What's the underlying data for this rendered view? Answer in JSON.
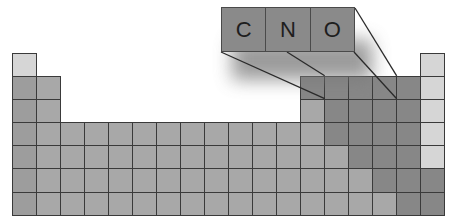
{
  "figure": {
    "callout": {
      "elements": [
        {
          "symbol": "C"
        },
        {
          "symbol": "N"
        },
        {
          "symbol": "O"
        }
      ]
    },
    "colors": {
      "light": "#d6d6d6",
      "mid": "#a8a8a8",
      "alkali": "#9d9d9d",
      "dark": "#878787",
      "callout": "#8a8a8a",
      "border": "#3a3a3a"
    },
    "grid": {
      "columns": 18,
      "rows": 7,
      "origin_x": 12,
      "origin_y": 52.7,
      "cell_w": 24,
      "cell_h": 23.15,
      "layout": [
        "L................L",
        "AM..........DDDDDL",
        "AM..........MDDDDL",
        "AMMMMMMMMMMMMDDDDL",
        "AMMMMMMMMMMMMMDDDL",
        "AMMMMMMMMMMMMMMDDD",
        "AMMMMMMMMMMMMMMMDD"
      ]
    },
    "zoom_lines": [
      {
        "x1": 221,
        "y1": 52,
        "x2": 324.7,
        "y2": 98.7
      },
      {
        "x1": 287,
        "y1": 52,
        "x2": 324.7,
        "y2": 75.8
      },
      {
        "x1": 354,
        "y1": 52,
        "x2": 396.7,
        "y2": 98.7
      },
      {
        "x1": 355,
        "y1": 8,
        "x2": 396.7,
        "y2": 75.8
      }
    ]
  }
}
